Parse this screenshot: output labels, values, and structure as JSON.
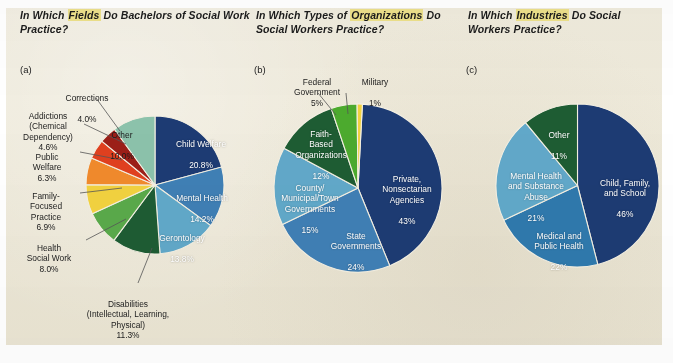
{
  "figure": {
    "background_color": "#ece7d6",
    "page_color": "#ffffff",
    "highlight_color": "#ece08a"
  },
  "panels": [
    {
      "letter": "(a)",
      "title_pre": "In Which ",
      "title_highlight": "Fields",
      "title_post": " Do Bachelors of  Social Work Practice?"
    },
    {
      "letter": "(b)",
      "title_pre": "In Which Types of ",
      "title_highlight": "Organizations",
      "title_post": " Do Social Workers Practice?"
    },
    {
      "letter": "(c)",
      "title_pre": "In Which ",
      "title_highlight": "Industries",
      "title_post": " Do Social Workers Practice?"
    }
  ],
  "chart_data": [
    {
      "type": "pie",
      "title": "In Which Fields Do Bachelors of  Social Work Practice?",
      "panel": "(a)",
      "value_suffix": "%",
      "legend": "labels attached to slices",
      "slices": [
        {
          "label": "Child Welfare",
          "value": 20.8,
          "value_text": "20.8%",
          "color": "#1d3b73",
          "label_placement": "inside"
        },
        {
          "label": "Mental Health",
          "value": 14.2,
          "value_text": "14.2%",
          "color": "#3f7fb5",
          "label_placement": "inside"
        },
        {
          "label": "Gerontology",
          "value": 13.8,
          "value_text": "13.8%",
          "color": "#61a8c9",
          "label_placement": "inside"
        },
        {
          "label": "Disabilities\n(Intellectual, Learning,\nPhysical)",
          "value": 11.3,
          "value_text": "11.3%",
          "color": "#1e5c33",
          "label_placement": "outside"
        },
        {
          "label": "Health\nSocial Work",
          "value": 8.0,
          "value_text": "8.0%",
          "color": "#5aa94a",
          "label_placement": "outside"
        },
        {
          "label": "Family-\nFocused\nPractice",
          "value": 6.9,
          "value_text": "6.9%",
          "color": "#f2d23f",
          "label_placement": "outside"
        },
        {
          "label": "Public\nWelfare",
          "value": 6.3,
          "value_text": "6.3%",
          "color": "#f08a2c",
          "label_placement": "outside"
        },
        {
          "label": "Addictions\n(Chemical\nDependency)",
          "value": 4.6,
          "value_text": "4.6%",
          "color": "#e0401f",
          "label_placement": "outside"
        },
        {
          "label": "Corrections",
          "value": 4.0,
          "value_text": "4.0%",
          "color": "#9c1f18",
          "label_placement": "outside"
        },
        {
          "label": "Other",
          "value": 10.0,
          "value_text": "10.0%",
          "color": "#8cc2ab",
          "label_placement": "inside"
        }
      ]
    },
    {
      "type": "pie",
      "title": "In Which Types of Organizations Do Social Workers Practice?",
      "panel": "(b)",
      "value_suffix": "%",
      "slices": [
        {
          "label": "Private,\nNonsectarian\nAgencies",
          "value": 43,
          "value_text": "43%",
          "color": "#1d3b73",
          "label_placement": "inside"
        },
        {
          "label": "State\nGovernments",
          "value": 24,
          "value_text": "24%",
          "color": "#3f7fb5",
          "label_placement": "inside"
        },
        {
          "label": "County/\nMunicipal/Town\nGovernments",
          "value": 15,
          "value_text": "15%",
          "color": "#61a8c9",
          "label_placement": "inside"
        },
        {
          "label": "Faith-\nBased\nOrganizations",
          "value": 12,
          "value_text": "12%",
          "color": "#1e5c33",
          "label_placement": "inside"
        },
        {
          "label": "Federal\nGovernment",
          "value": 5,
          "value_text": "5%",
          "color": "#4caa2e",
          "label_placement": "outside"
        },
        {
          "label": "Military",
          "value": 1,
          "value_text": "1%",
          "color": "#f2d23f",
          "label_placement": "outside"
        }
      ]
    },
    {
      "type": "pie",
      "title": "In Which Industries Do Social Workers Practice?",
      "panel": "(c)",
      "value_suffix": "%",
      "slices": [
        {
          "label": "Child, Family,\nand School",
          "value": 46,
          "value_text": "46%",
          "color": "#1d3b73",
          "label_placement": "inside"
        },
        {
          "label": "Medical and\nPublic Health",
          "value": 22,
          "value_text": "22%",
          "color": "#2f79ad",
          "label_placement": "inside"
        },
        {
          "label": "Mental Health\nand Substance\nAbuse",
          "value": 21,
          "value_text": "21%",
          "color": "#61a8c9",
          "label_placement": "inside"
        },
        {
          "label": "Other",
          "value": 11,
          "value_text": "11%",
          "color": "#1e5c33",
          "label_placement": "inside"
        }
      ]
    }
  ]
}
